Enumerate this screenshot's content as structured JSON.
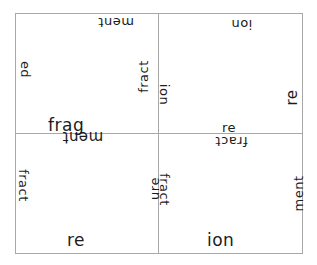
{
  "puzzle": {
    "type": "word-fragment-tiles",
    "tiles": [
      {
        "position": "top-left",
        "top": "ment",
        "left": "ed",
        "right": "fract",
        "bottom": "frag"
      },
      {
        "position": "top-right",
        "top": "ion",
        "left": "ion",
        "right": "re",
        "bottom": "re"
      },
      {
        "position": "bottom-left",
        "top": "ment",
        "left": "fract",
        "right": "ure",
        "bottom": "re"
      },
      {
        "position": "bottom-right",
        "top": "fract",
        "left": "fract",
        "right": "ment",
        "bottom": "ion"
      }
    ]
  }
}
